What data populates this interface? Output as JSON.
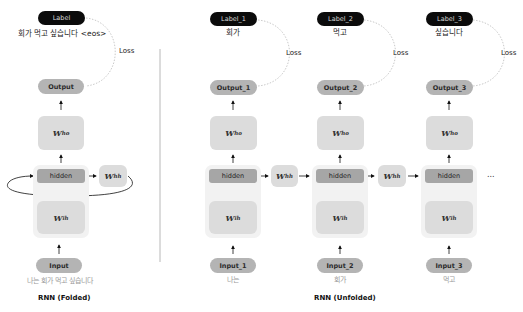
{
  "folded": {
    "label": "Label",
    "label_text": "회가 먹고 싶습니다 <eos>",
    "loss": "Loss",
    "output": "Output",
    "w_ho": {
      "base": "W",
      "sub": "ho"
    },
    "hidden": "hidden",
    "w_hh": {
      "base": "W",
      "sub": "hh"
    },
    "w_ih": {
      "base": "W",
      "sub": "ih"
    },
    "input": "Input",
    "input_text": "나는 회가 먹고 싶습니다",
    "caption": "RNN (Folded)"
  },
  "unfolded": {
    "caption": "RNN (Unfolded)",
    "ellipsis": "...",
    "w_hh": {
      "base": "W",
      "sub": "hh"
    },
    "steps": [
      {
        "label": "Label_1",
        "label_text": "회가",
        "loss": "Loss",
        "output": "Output_1",
        "w_ho": {
          "base": "W",
          "sub": "ho"
        },
        "hidden": "hidden",
        "w_ih": {
          "base": "W",
          "sub": "ih"
        },
        "input": "Input_1",
        "input_text": "나는"
      },
      {
        "label": "Label_2",
        "label_text": "먹고",
        "loss": "Loss",
        "output": "Output_2",
        "w_ho": {
          "base": "W",
          "sub": "ho"
        },
        "hidden": "hidden",
        "w_ih": {
          "base": "W",
          "sub": "ih"
        },
        "input": "Input_2",
        "input_text": "회가"
      },
      {
        "label": "Label_3",
        "label_text": "싶습니다",
        "loss": "Loss",
        "output": "Output_3",
        "w_ho": {
          "base": "W",
          "sub": "ho"
        },
        "hidden": "hidden",
        "w_ih": {
          "base": "W",
          "sub": "ih"
        },
        "input": "Input_3",
        "input_text": "먹고"
      }
    ]
  },
  "colors": {
    "label_bg": "#0b0b0b",
    "output_bg": "#b4b4b4",
    "weight_bg": "#dcdcdc",
    "hidden_bg": "#a6a6a6",
    "outer_bg": "#f2f2f2",
    "divider": "#b8b8b8"
  }
}
